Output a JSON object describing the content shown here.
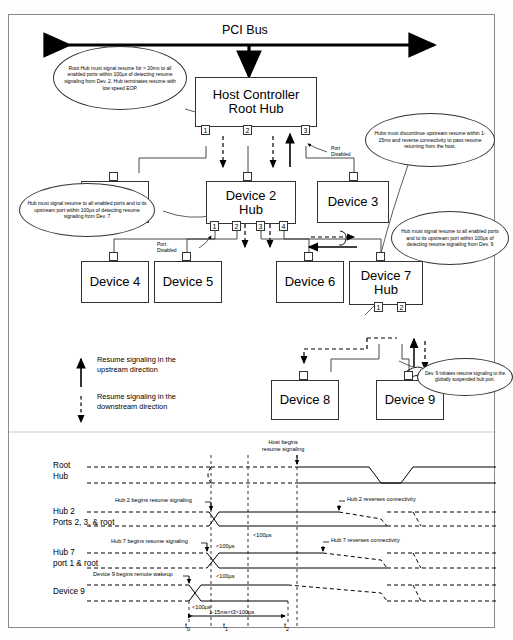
{
  "diagram": {
    "bus_label": "PCI Bus",
    "root": {
      "line1": "Host Controller",
      "line2": "Root Hub",
      "ports": [
        "1",
        "2",
        "3"
      ],
      "port_disabled_label": "Port\nDisabled"
    },
    "devices": [
      {
        "id": "device1",
        "line1": "Device 1",
        "line2": ""
      },
      {
        "id": "device2",
        "line1": "Device 2",
        "line2": "Hub",
        "ports": [
          "1",
          "2",
          "3",
          "4"
        ],
        "port_disabled_label": "Port\nDisabled"
      },
      {
        "id": "device3",
        "line1": "Device 3",
        "line2": ""
      },
      {
        "id": "device4",
        "line1": "Device 4",
        "line2": ""
      },
      {
        "id": "device5",
        "line1": "Device 5",
        "line2": ""
      },
      {
        "id": "device6",
        "line1": "Device 6",
        "line2": ""
      },
      {
        "id": "device7",
        "line1": "Device 7",
        "line2": "Hub",
        "ports": [
          "1",
          "2"
        ]
      },
      {
        "id": "device8",
        "line1": "Device 8",
        "line2": ""
      },
      {
        "id": "device9",
        "line1": "Device 9",
        "line2": ""
      }
    ],
    "callouts": [
      {
        "id": "callout-root-hub",
        "text": "Root Hub must signal resume for >  20ms to all enabled ports within 100µs of detecting resume signaling from Dev. 2. Hub terminates resume with low speed EOP."
      },
      {
        "id": "callout-hubs-discontinue",
        "text": "Hubs must discontinue upstream resume within 1-15ms and reverse connectivity to pass resume returning from the host."
      },
      {
        "id": "callout-hub-dev7",
        "text": "Hub must signal resume to all enabled ports and to its upstream port within 100µs of detecting resume signaling from Dev. 7"
      },
      {
        "id": "callout-hub-dev9",
        "text": "Hub must signal resume to all enabled ports and to its upstream port within 100µs of detecting resume signaling from Dev. 9"
      },
      {
        "id": "callout-dev9-initiates",
        "text": "Dev. 9 initiates resume signaling to the globally suspended hub port."
      }
    ],
    "legend": [
      {
        "id": "legend-upstream",
        "marker": "solid-up-arrow",
        "text": "Resume signaling in the upstream direction"
      },
      {
        "id": "legend-downstream",
        "marker": "dashed-down-arrow",
        "text": "Resume signaling in the downstream direction"
      }
    ]
  },
  "timing": {
    "rows": [
      {
        "id": "row-root-hub",
        "line1": "Root",
        "line2": "Hub"
      },
      {
        "id": "row-hub2",
        "line1": "Hub 2",
        "line2": "Ports 2, 3, & root"
      },
      {
        "id": "row-hub7",
        "line1": "Hub 7",
        "line2": "port 1 & root"
      },
      {
        "id": "row-device9",
        "line1": "Device 9",
        "line2": ""
      }
    ],
    "annotations": [
      {
        "id": "annot-host-begins",
        "text": "Host begins\nresume signaling"
      },
      {
        "id": "annot-hub2-begins",
        "text": "Hub 2 begins resume signaling"
      },
      {
        "id": "annot-hub2-reverses",
        "text": "Hub 2 reverses connectivity"
      },
      {
        "id": "annot-hub7-begins",
        "text": "Hub 7 begins resume signaling"
      },
      {
        "id": "annot-hub7-reverses",
        "text": "Hub 7 reverses connectivity"
      },
      {
        "id": "annot-dev9-wakeup",
        "text": "Device 9 begins remote wakeup"
      }
    ],
    "durations": [
      {
        "id": "dur-hub2",
        "text": "<100µs"
      },
      {
        "id": "dur-hub7",
        "text": "<100µs"
      },
      {
        "id": "dur-dev9",
        "text": "<100µs"
      },
      {
        "id": "dur-span",
        "text": "1-15ms<t3>100µs"
      }
    ],
    "time_marks": [
      {
        "id": "t0",
        "label": "t",
        "sub": "0"
      },
      {
        "id": "t1",
        "label": "t",
        "sub": "1"
      },
      {
        "id": "t2",
        "label": "t",
        "sub": "2"
      }
    ]
  },
  "colors": {
    "line": "#333333",
    "text": "#000000",
    "bg": "#ffffff"
  }
}
